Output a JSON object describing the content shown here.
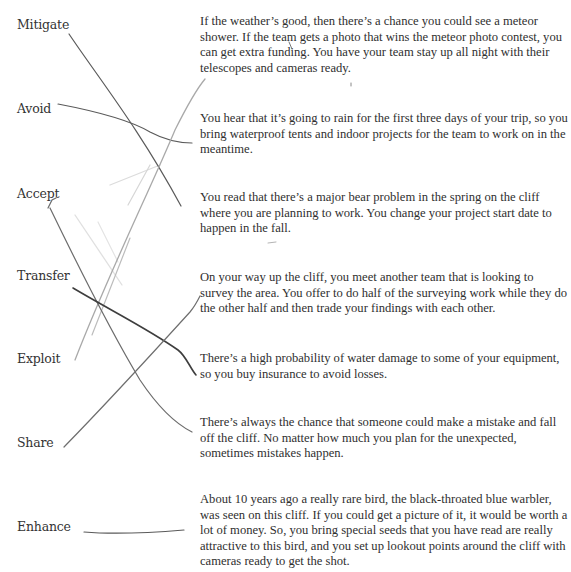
{
  "worksheet": {
    "terms": [
      {
        "id": "mitigate",
        "label": "Mitigate"
      },
      {
        "id": "avoid",
        "label": "Avoid"
      },
      {
        "id": "accept",
        "label": "Accept"
      },
      {
        "id": "transfer",
        "label": "Transfer"
      },
      {
        "id": "exploit",
        "label": "Exploit"
      },
      {
        "id": "share",
        "label": "Share"
      },
      {
        "id": "enhance",
        "label": "Enhance"
      }
    ],
    "scenarios": [
      {
        "text": "If the weather’s good, then there’s a chance you could see a meteor shower. If the team gets a photo that wins the meteor photo contest, you can get extra funding. You have your team stay up all night with their telescopes and cameras ready."
      },
      {
        "text": "You hear that it’s going to rain for the first three days of your trip, so you bring waterproof tents and indoor projects for the team to work on in the meantime."
      },
      {
        "text": "You read that there’s a major bear problem in the spring on the cliff where you are planning to work. You change your project start date to happen in the fall."
      },
      {
        "text": "On your way up the cliff, you meet another team that is looking to survey the area. You offer to do half of the surveying work while they do the other half and then trade your findings with each other."
      },
      {
        "text": "There’s a high probability of water damage to some of your equipment, so you buy insurance to avoid losses."
      },
      {
        "text": "There’s always the chance that someone could make a mistake and fall off the cliff. No matter how much you plan for the unexpected, sometimes mistakes happen."
      },
      {
        "text": "About 10 years ago a really rare bird, the black-throated blue warbler, was seen on this cliff. If you could get a picture of it, it would be worth a lot of money. So, you bring special seeds that you have read are really attractive to this bird, and you set up lookout points around the cliff with cameras ready to get the shot."
      }
    ],
    "hand_drawn_matches": [
      {
        "from": "Mitigate",
        "to_scenario": 3
      },
      {
        "from": "Avoid",
        "to_scenario": 2
      },
      {
        "from": "Accept",
        "to_scenario": 6
      },
      {
        "from": "Transfer",
        "to_scenario": 5
      },
      {
        "from": "Exploit",
        "to_scenario": 1
      },
      {
        "from": "Share",
        "to_scenario": 4
      },
      {
        "from": "Enhance",
        "to_scenario": 7
      }
    ],
    "colors": {
      "pencil_dark": "#4a4a4a",
      "pencil_mid": "#777777",
      "pencil_light": "#c4c4c4"
    }
  }
}
